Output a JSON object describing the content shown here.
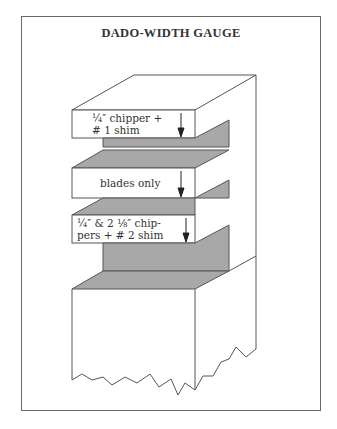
{
  "title": "DADO-WIDTH GAUGE",
  "colors": {
    "line": "#555555",
    "shade": "#a8a8a8",
    "frame": "#6a6a6a"
  },
  "steps": [
    {
      "label_line1": "¼″ chipper +",
      "label_line2": "# 1 shim"
    },
    {
      "label_line1": "blades only",
      "label_line2": ""
    },
    {
      "label_line1": "¼″ & 2 ⅛″ chip-",
      "label_line2": "pers + # 2 shim"
    }
  ]
}
